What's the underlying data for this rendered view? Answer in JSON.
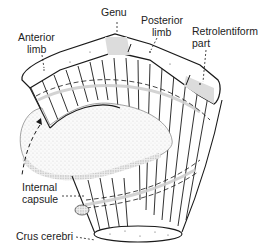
{
  "diagram": {
    "labels": {
      "genu": "Genu",
      "anterior_limb_l1": "Anterior",
      "anterior_limb_l2": "limb",
      "posterior_limb_l1": "Posterior",
      "posterior_limb_l2": "limb",
      "retrolentiform_l1": "Retrolentiform",
      "retrolentiform_l2": "part",
      "internal_capsule_l1": "Internal",
      "internal_capsule_l2": "capsule",
      "crus_cerebri": "Crus cerebri"
    },
    "colors": {
      "line": "#1a1a1a",
      "shade": "#d9d9d9",
      "background": "#ffffff"
    }
  }
}
